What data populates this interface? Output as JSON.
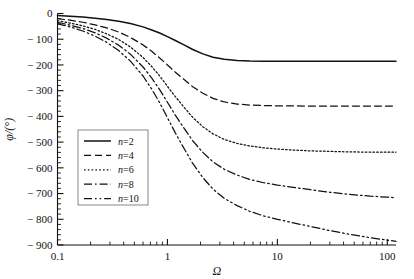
{
  "chart_data": {
    "type": "line",
    "title": "",
    "xlabel": "Ω",
    "ylabel": "φ/(°)",
    "xscale": "log",
    "xlim": [
      0.1,
      120
    ],
    "ylim": [
      -900,
      0
    ],
    "grid": false,
    "legend_position": "center-left",
    "xticks": [
      0.1,
      1,
      10,
      100
    ],
    "xtick_labels": [
      "0.1",
      "1",
      "10",
      "100"
    ],
    "yticks": [
      0,
      -100,
      -200,
      -300,
      -400,
      -500,
      -600,
      -700,
      -800,
      -900
    ],
    "ytick_labels": [
      "0",
      "− 100",
      "− 200",
      "− 300",
      "− 400",
      "− 500",
      "− 600",
      "− 700",
      "− 800",
      "− 900"
    ],
    "x": [
      0.1,
      0.13,
      0.17,
      0.22,
      0.28,
      0.36,
      0.46,
      0.6,
      0.72,
      0.85,
      1.0,
      1.18,
      1.4,
      1.7,
      2.1,
      2.6,
      3.3,
      4.3,
      5.6,
      7.5,
      10,
      14,
      20,
      30,
      45,
      70,
      100,
      120
    ],
    "series": [
      {
        "name": "n=2",
        "order": 2,
        "style": "solid",
        "asymptote": -180,
        "values": [
          -8,
          -11,
          -14,
          -18,
          -23,
          -30,
          -39,
          -52,
          -64,
          -76,
          -90,
          -105,
          -121,
          -140,
          -157,
          -170,
          -178,
          -183,
          -185,
          -186,
          -186,
          -186,
          -186,
          -186,
          -186,
          -186,
          -186,
          -186
        ]
      },
      {
        "name": "n=4",
        "order": 4,
        "style": "dashed",
        "asymptote": -360,
        "values": [
          -20,
          -26,
          -34,
          -44,
          -56,
          -72,
          -93,
          -122,
          -147,
          -173,
          -200,
          -228,
          -255,
          -285,
          -310,
          -330,
          -344,
          -352,
          -356,
          -358,
          -359,
          -359,
          -360,
          -360,
          -360,
          -360,
          -360,
          -360
        ]
      },
      {
        "name": "n=6",
        "order": 6,
        "style": "dotted",
        "asymptote": -540,
        "values": [
          -28,
          -37,
          -48,
          -62,
          -79,
          -101,
          -130,
          -171,
          -206,
          -243,
          -283,
          -323,
          -362,
          -404,
          -440,
          -468,
          -490,
          -505,
          -515,
          -522,
          -527,
          -531,
          -534,
          -536,
          -538,
          -539,
          -539,
          -539
        ]
      },
      {
        "name": "n=8",
        "order": 8,
        "style": "dashdot",
        "asymptote": -720,
        "values": [
          -34,
          -45,
          -58,
          -75,
          -96,
          -123,
          -158,
          -208,
          -251,
          -296,
          -345,
          -395,
          -443,
          -495,
          -540,
          -577,
          -606,
          -628,
          -645,
          -658,
          -667,
          -676,
          -685,
          -695,
          -703,
          -710,
          -714,
          -716
        ]
      },
      {
        "name": "n=10",
        "order": 10,
        "style": "dashdotdot",
        "asymptote": -900,
        "values": [
          -40,
          -52,
          -68,
          -88,
          -112,
          -144,
          -185,
          -243,
          -294,
          -347,
          -405,
          -464,
          -521,
          -583,
          -638,
          -683,
          -719,
          -747,
          -769,
          -787,
          -800,
          -814,
          -828,
          -844,
          -858,
          -872,
          -881,
          -886
        ]
      }
    ]
  },
  "legend": {
    "entries": [
      {
        "label_var": "n",
        "label_value": "=2"
      },
      {
        "label_var": "n",
        "label_value": "=4"
      },
      {
        "label_var": "n",
        "label_value": "=6"
      },
      {
        "label_var": "n",
        "label_value": "=8"
      },
      {
        "label_var": "n",
        "label_value": "=10"
      }
    ]
  },
  "axis": {
    "x_title": "Ω",
    "y_title": "φ/(°)"
  }
}
